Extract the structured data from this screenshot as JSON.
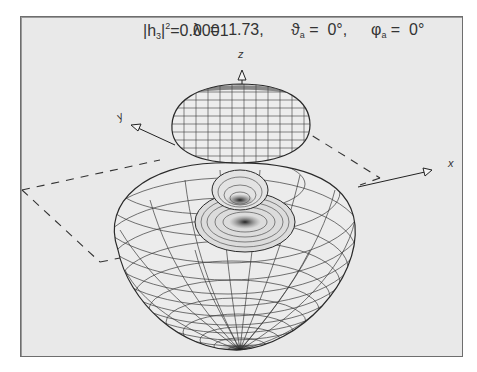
{
  "title": {
    "amplitude_label": "|h",
    "amplitude_sub": "3",
    "amplitude_after": "|",
    "amplitude_sup": "2",
    "amplitude_value": "=0.0001",
    "lambda_label": "λ  =  1.73,",
    "theta_label": "ϑ",
    "theta_sub": "a",
    "theta_value": " =  0°,",
    "phi_label": "φ",
    "phi_sub": "a",
    "phi_value": " =  0°"
  },
  "axes": {
    "z_label": "z",
    "y_label": "y",
    "x_label": "x"
  },
  "colors": {
    "background": "#e9e9e9",
    "frame_border": "#6e6e6e",
    "mesh_line": "#3a3a3a",
    "shadow": "#1a1a1a"
  }
}
